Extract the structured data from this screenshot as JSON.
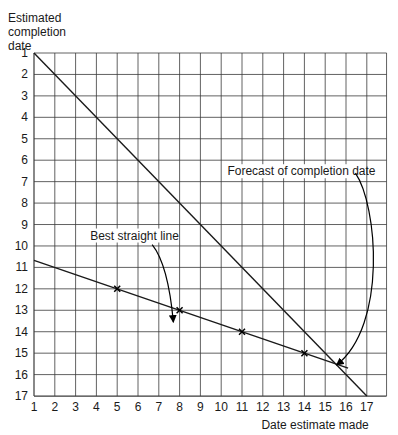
{
  "chart_data": {
    "type": "line",
    "title": "",
    "xlabel": "Date estimate made",
    "ylabel_lines": [
      "Estimated",
      "completion",
      "date"
    ],
    "x_ticks": [
      1,
      2,
      3,
      4,
      5,
      6,
      7,
      8,
      9,
      10,
      11,
      12,
      13,
      14,
      15,
      16,
      17
    ],
    "y_ticks": [
      1,
      2,
      3,
      4,
      5,
      6,
      7,
      8,
      9,
      10,
      11,
      12,
      13,
      14,
      15,
      16,
      17
    ],
    "xlim": [
      1,
      17.95
    ],
    "ylim": [
      1,
      17
    ],
    "y_inverted": true,
    "grid": true,
    "series": [
      {
        "name": "Diagonal (estimate = date made)",
        "type": "line",
        "points": [
          [
            1,
            1
          ],
          [
            17,
            17
          ]
        ]
      },
      {
        "name": "Best straight line",
        "type": "line",
        "points": [
          [
            1,
            10.67
          ],
          [
            16.1,
            15.7
          ]
        ]
      },
      {
        "name": "Estimates",
        "type": "scatter",
        "marker": "x",
        "points": [
          [
            5,
            12
          ],
          [
            8,
            13
          ],
          [
            11,
            14
          ],
          [
            14,
            15
          ]
        ]
      }
    ],
    "annotations": [
      {
        "text": "Best straight line",
        "text_at": [
          3.7,
          9.7
        ],
        "arrow_to": [
          7.7,
          13.55
        ]
      },
      {
        "text": "Forecast of completion date",
        "text_at": [
          10.3,
          6.7
        ],
        "arrow_to": [
          15.55,
          15.55
        ]
      }
    ]
  }
}
